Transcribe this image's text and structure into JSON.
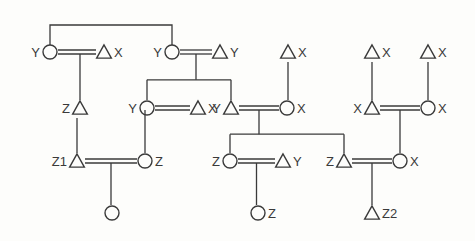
{
  "diagram": {
    "type": "kinship-chart",
    "legend_semantics": {
      "triangle": "male",
      "circle": "female",
      "double-line": "marriage",
      "vertical-line": "descent"
    },
    "colors": {
      "ink": "#3a3a3a",
      "background": "#fdfdfb"
    },
    "individuals": [
      {
        "id": "g1a_w",
        "symbol": "circle",
        "label": "Y",
        "label_side": "left",
        "x": 50,
        "y": 52
      },
      {
        "id": "g1a_h",
        "symbol": "triangle",
        "label": "X",
        "label_side": "right",
        "x": 104,
        "y": 52
      },
      {
        "id": "g1b_w",
        "symbol": "circle",
        "label": "Y",
        "label_side": "left",
        "x": 172,
        "y": 52
      },
      {
        "id": "g1b_h",
        "symbol": "triangle",
        "label": "Y",
        "label_side": "right",
        "x": 220,
        "y": 52
      },
      {
        "id": "g1c",
        "symbol": "triangle",
        "label": "X",
        "label_side": "right",
        "x": 288,
        "y": 52
      },
      {
        "id": "g1d",
        "symbol": "triangle",
        "label": "X",
        "label_side": "right",
        "x": 372,
        "y": 52
      },
      {
        "id": "g1e",
        "symbol": "triangle",
        "label": "X",
        "label_side": "right",
        "x": 428,
        "y": 52
      },
      {
        "id": "g2a",
        "symbol": "triangle",
        "label": "Z",
        "label_side": "left",
        "x": 80,
        "y": 108
      },
      {
        "id": "g2b_w",
        "symbol": "circle",
        "label": "Y",
        "label_side": "left",
        "x": 147,
        "y": 108
      },
      {
        "id": "g2b_h",
        "symbol": "triangle",
        "label": "X",
        "label_side": "right",
        "x": 198,
        "y": 108
      },
      {
        "id": "g2c_h",
        "symbol": "triangle",
        "label": "Y",
        "label_side": "left",
        "x": 231,
        "y": 108
      },
      {
        "id": "g2c_w",
        "symbol": "circle",
        "label": "X",
        "label_side": "right",
        "x": 287,
        "y": 108
      },
      {
        "id": "g2d_h",
        "symbol": "triangle",
        "label": "X",
        "label_side": "left",
        "x": 372,
        "y": 108
      },
      {
        "id": "g2d_w",
        "symbol": "circle",
        "label": "X",
        "label_side": "right",
        "x": 428,
        "y": 108
      },
      {
        "id": "g3a_h",
        "symbol": "triangle",
        "label": "Z1",
        "label_side": "left",
        "x": 77,
        "y": 161
      },
      {
        "id": "g3a_w",
        "symbol": "circle",
        "label": "Z",
        "label_side": "right",
        "x": 145,
        "y": 161
      },
      {
        "id": "g3b_w",
        "symbol": "circle",
        "label": "Z",
        "label_side": "left",
        "x": 230,
        "y": 161
      },
      {
        "id": "g3b_h",
        "symbol": "triangle",
        "label": "Y",
        "label_side": "right",
        "x": 283,
        "y": 161
      },
      {
        "id": "g3c_h",
        "symbol": "triangle",
        "label": "Z",
        "label_side": "left",
        "x": 344,
        "y": 161
      },
      {
        "id": "g3c_w",
        "symbol": "circle",
        "label": "X",
        "label_side": "right",
        "x": 400,
        "y": 161
      },
      {
        "id": "g4a",
        "symbol": "circle",
        "label": "",
        "label_side": "right",
        "x": 112,
        "y": 213
      },
      {
        "id": "g4b",
        "symbol": "circle",
        "label": "Z",
        "label_side": "right",
        "x": 258,
        "y": 213
      },
      {
        "id": "g4c",
        "symbol": "triangle",
        "label": "Z2",
        "label_side": "right",
        "x": 372,
        "y": 213
      }
    ],
    "marriages": [
      {
        "from": "g1a_w",
        "to": "g1a_h"
      },
      {
        "from": "g1b_w",
        "to": "g1b_h"
      },
      {
        "from": "g2b_w",
        "to": "g2b_h"
      },
      {
        "from": "g2c_h",
        "to": "g2c_w"
      },
      {
        "from": "g2d_h",
        "to": "g2d_w"
      },
      {
        "from": "g3a_h",
        "to": "g3a_w"
      },
      {
        "from": "g3b_w",
        "to": "g3b_h"
      },
      {
        "from": "g3c_h",
        "to": "g3c_w"
      }
    ],
    "sibling_links": [
      {
        "between": [
          "g1a_w",
          "g1b_w"
        ],
        "bar_y": 25
      }
    ],
    "descents": [
      {
        "parents": [
          "g1a_w",
          "g1a_h"
        ],
        "children": [
          "g2a"
        ]
      },
      {
        "parents": [
          "g1b_w",
          "g1b_h"
        ],
        "children": [
          "g2b_w",
          "g2c_h"
        ]
      },
      {
        "parents": [
          "g1c"
        ],
        "children": [
          "g2c_w"
        ]
      },
      {
        "parents": [
          "g1d"
        ],
        "children": [
          "g2d_h"
        ]
      },
      {
        "parents": [
          "g1e"
        ],
        "children": [
          "g2d_w"
        ]
      },
      {
        "parents": [
          "g2a"
        ],
        "children": [
          "g3a_h"
        ]
      },
      {
        "parents": [
          "g2b_w",
          "g2b_h"
        ],
        "children": [
          "g3a_w"
        ]
      },
      {
        "parents": [
          "g2c_h",
          "g2c_w"
        ],
        "children": [
          "g3b_w",
          "g3c_h"
        ]
      },
      {
        "parents": [
          "g2d_h",
          "g2d_w"
        ],
        "children": [
          "g3c_w"
        ]
      },
      {
        "parents": [
          "g3a_h",
          "g3a_w"
        ],
        "children": [
          "g4a"
        ]
      },
      {
        "parents": [
          "g3b_w",
          "g3b_h"
        ],
        "children": [
          "g4b"
        ]
      },
      {
        "parents": [
          "g3c_h",
          "g3c_w"
        ],
        "children": [
          "g4c"
        ]
      }
    ]
  }
}
